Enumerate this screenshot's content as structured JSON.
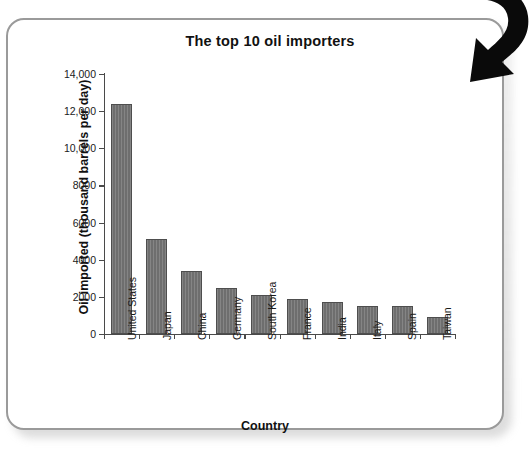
{
  "chart_data": {
    "type": "bar",
    "title": "The top 10 oil importers",
    "xlabel": "Country",
    "ylabel": "Oil imported (thousand barrels per day)",
    "categories": [
      "United States",
      "Japan",
      "China",
      "Germany",
      "South Korea",
      "France",
      "India",
      "Italy",
      "Spain",
      "Taiwan"
    ],
    "values": [
      12400,
      5100,
      3400,
      2500,
      2100,
      1900,
      1700,
      1500,
      1500,
      900
    ],
    "ylim": [
      0,
      14000
    ],
    "ytick_values": [
      0,
      2000,
      4000,
      6000,
      8000,
      10000,
      12000,
      14000
    ],
    "ytick_labels": [
      "0",
      "2000",
      "4000",
      "6000",
      "8000",
      "10,000",
      "12,000",
      "14,000"
    ],
    "grid": false,
    "legend": false,
    "bar_color": "#6e6e6e",
    "bar_edge_color": "#4e4e4e",
    "axis_color": "#4a4a4a",
    "text_color": "#111111",
    "background": "#ffffff"
  },
  "figure": {
    "frame_color": "#9a9a9a",
    "arrow": {
      "icon": "curved-down-right-arrow-icon",
      "color": "#0a0a0a"
    }
  }
}
